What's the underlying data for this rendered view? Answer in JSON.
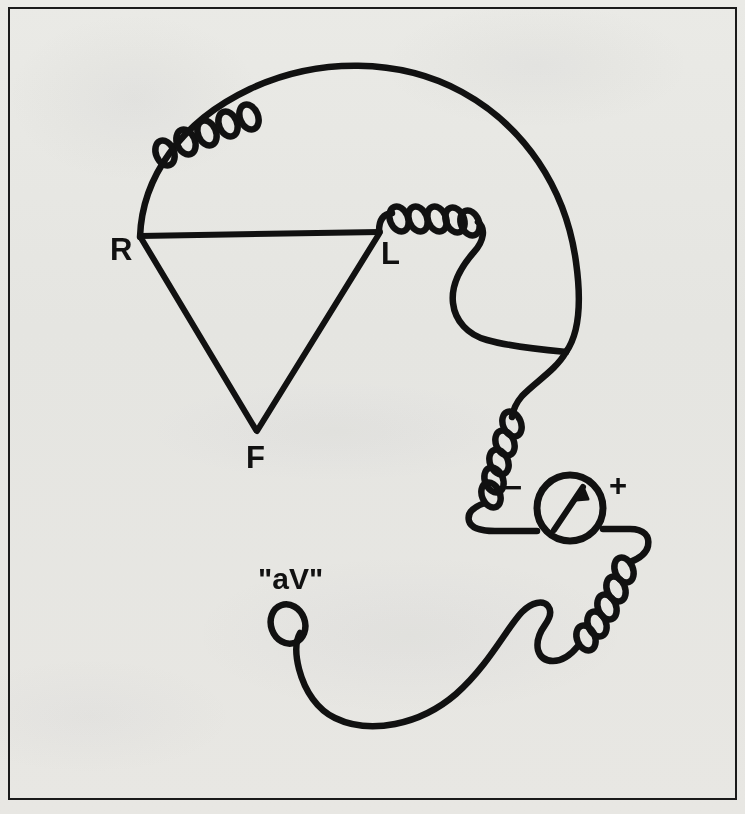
{
  "figure": {
    "lead_label": "\"aV\"",
    "ink_color": "#111111",
    "paper_color": "#f3f3f1",
    "border_color": "#1a1a1a",
    "electrodes": [
      {
        "id": "right-arm",
        "label": "R",
        "x": 118,
        "y": 249
      },
      {
        "id": "left-arm",
        "label": "L",
        "x": 384,
        "y": 253
      },
      {
        "id": "foot",
        "label": "F",
        "x": 246,
        "y": 470
      }
    ],
    "galvanometer": {
      "name": "galvanometer",
      "center_x": 570,
      "center_y": 508,
      "radius": 33,
      "negative_terminal": "−",
      "positive_terminal": "+",
      "negative_x": 505,
      "negative_y": 478,
      "positive_x": 608,
      "positive_y": 478,
      "needle_direction": "up-right"
    },
    "coils": [
      {
        "id": "coil-upper-left",
        "turns": 5
      },
      {
        "id": "coil-left-arm",
        "turns": 5
      },
      {
        "id": "coil-meter-minus",
        "turns": 5
      },
      {
        "id": "coil-meter-plus",
        "turns": 5
      }
    ],
    "wire_terminal": {
      "id": "free-end-loop",
      "shape": "open loop",
      "x": 288,
      "y": 625
    }
  }
}
